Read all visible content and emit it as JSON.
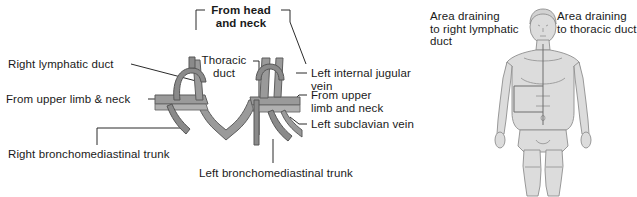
{
  "figure": {
    "title_bracket": "From head\nand neck",
    "left_panel": {
      "labels": [
        {
          "id": "right-lymphatic-duct",
          "text": "Right lymphatic duct"
        },
        {
          "id": "from-upper-limb-neck",
          "text": "From upper limb & neck"
        },
        {
          "id": "right-bronchomediastinal-trunk",
          "text": "Right bronchomediastinal trunk"
        },
        {
          "id": "thoracic-duct",
          "text": "Thoracic\nduct"
        },
        {
          "id": "from-head-and-neck",
          "text": "From head\nand neck"
        },
        {
          "id": "left-internal-jugular-vein",
          "text": "Left internal jugular\nvein"
        },
        {
          "id": "from-upper-limb-and-neck",
          "text": "From upper\nlimb and neck"
        },
        {
          "id": "left-subclavian-vein",
          "text": "Left subclavian vein"
        },
        {
          "id": "left-bronchomediastinal-trunk",
          "text": "Left bronchomediastinal trunk"
        }
      ]
    },
    "right_panel": {
      "labels": [
        {
          "id": "area-right-lymphatic-duct",
          "text": "Area draining\nto right lymphatic\nduct"
        },
        {
          "id": "area-thoracic-duct",
          "text": "Area draining\nto thoracic duct"
        }
      ],
      "body_figure_name": "human-body-drainage-figure"
    },
    "colors": {
      "vessel": "#9a9a9a",
      "vessel_outline": "#5d5d5d",
      "body_fill": "#dcdcdc",
      "body_outline": "#8f8f8f",
      "text": "#1a1a1a",
      "background": "#ffffff"
    }
  }
}
